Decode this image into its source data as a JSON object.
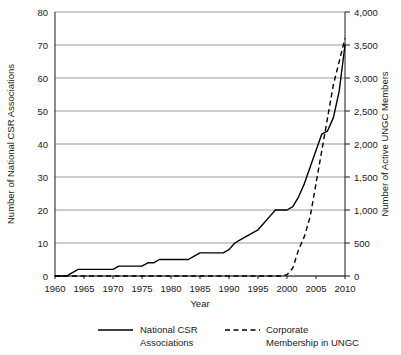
{
  "chart_data": {
    "type": "line",
    "title": "",
    "xlabel": "Year",
    "ylabel": "Number of National CSR Associations",
    "y2label": "Number of Active UNGC Members",
    "xlim": [
      1960,
      2010
    ],
    "ylim": [
      0,
      80
    ],
    "y2lim": [
      0,
      4000
    ],
    "grid": true,
    "legend_position": "bottom",
    "xticks": [
      "1960",
      "1965",
      "1970",
      "1975",
      "1980",
      "1985",
      "1990",
      "1995",
      "2000",
      "2005",
      "2010"
    ],
    "xtick_values": [
      1960,
      1965,
      1970,
      1975,
      1980,
      1985,
      1990,
      1995,
      2000,
      2005,
      2010
    ],
    "yticks": [
      "0",
      "10",
      "20",
      "30",
      "40",
      "50",
      "60",
      "70",
      "80"
    ],
    "ytick_values": [
      0,
      10,
      20,
      30,
      40,
      50,
      60,
      70,
      80
    ],
    "y2ticks": [
      "0",
      "500",
      "1,000",
      "1,500",
      "2,000",
      "2,500",
      "3,000",
      "3,500",
      "4,000"
    ],
    "y2tick_values": [
      0,
      500,
      1000,
      1500,
      2000,
      2500,
      3000,
      3500,
      4000
    ],
    "series": [
      {
        "name": "National CSR Associations",
        "axis": "left",
        "style": "solid",
        "color": "#000000",
        "x": [
          1960,
          1961,
          1962,
          1963,
          1964,
          1965,
          1966,
          1967,
          1968,
          1969,
          1970,
          1971,
          1972,
          1973,
          1974,
          1975,
          1976,
          1977,
          1978,
          1979,
          1980,
          1981,
          1982,
          1983,
          1984,
          1985,
          1986,
          1987,
          1988,
          1989,
          1990,
          1991,
          1992,
          1993,
          1994,
          1995,
          1996,
          1997,
          1998,
          1999,
          2000,
          2001,
          2002,
          2003,
          2004,
          2005,
          2006,
          2007,
          2008,
          2009,
          2010
        ],
        "values": [
          0,
          0,
          0,
          1,
          2,
          2,
          2,
          2,
          2,
          2,
          2,
          3,
          3,
          3,
          3,
          3,
          4,
          4,
          5,
          5,
          5,
          5,
          5,
          5,
          6,
          7,
          7,
          7,
          7,
          7,
          8,
          10,
          11,
          12,
          13,
          14,
          16,
          18,
          20,
          20,
          20,
          21,
          24,
          28,
          33,
          38,
          43,
          44,
          48,
          56,
          70
        ]
      },
      {
        "name": "Corporate Membership in UNGC",
        "axis": "right",
        "style": "dashed",
        "color": "#000000",
        "x": [
          1960,
          1985,
          1995,
          1999,
          2000,
          2001,
          2002,
          2003,
          2004,
          2005,
          2006,
          2007,
          2008,
          2009,
          2010
        ],
        "values": [
          0,
          0,
          0,
          0,
          20,
          120,
          400,
          600,
          900,
          1400,
          1900,
          2400,
          2900,
          3250,
          3600
        ]
      }
    ]
  },
  "legend": {
    "entries": [
      {
        "label_line1": "National CSR",
        "label_line2": "Associations",
        "style": "solid"
      },
      {
        "label_line1": "Corporate",
        "label_line2": "Membership in UNGC",
        "style": "dashed"
      }
    ]
  }
}
